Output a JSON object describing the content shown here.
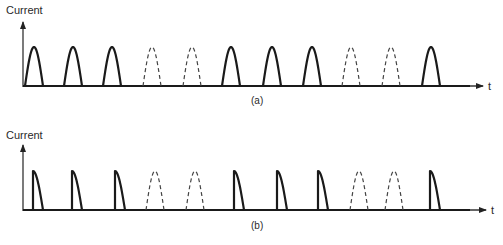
{
  "panels": [
    {
      "id": "a",
      "y_label": "Current",
      "x_label": "t",
      "caption": "(a)",
      "pulse_shape": "full half-sine",
      "pulses": [
        "solid",
        "solid",
        "solid",
        "dashed",
        "dashed",
        "solid",
        "solid",
        "solid",
        "dashed",
        "dashed",
        "solid"
      ]
    },
    {
      "id": "b",
      "y_label": "Current",
      "x_label": "t",
      "caption": "(b)",
      "pulse_shape": "phase-chopped (trailing portion) for solid; full half-sine for dashed",
      "pulses": [
        "solid",
        "solid",
        "solid",
        "dashed",
        "dashed",
        "solid",
        "solid",
        "solid",
        "dashed",
        "dashed",
        "solid"
      ]
    }
  ],
  "chart_data": [
    {
      "type": "line",
      "title": "(a)",
      "xlabel": "t",
      "ylabel": "Current",
      "description": "Half-wave rectified pulse train; 11 pulse slots, pattern 3 conducting, 2 skipped (dashed), 3 conducting, 2 skipped, 1 conducting",
      "pulse_start_x": [
        25,
        64,
        103,
        143,
        183,
        222,
        263,
        303,
        342,
        382,
        422
      ],
      "pulse_width": 18,
      "pulse_style": [
        "solid",
        "solid",
        "solid",
        "dashed",
        "dashed",
        "solid",
        "solid",
        "solid",
        "dashed",
        "dashed",
        "solid"
      ],
      "baseline_y": 86,
      "peak_y": 47,
      "axis_origin": [
        22,
        86
      ],
      "axis_x_end": 482,
      "axis_y_top": 24
    },
    {
      "type": "line",
      "title": "(b)",
      "xlabel": "t",
      "ylabel": "Current",
      "description": "Phase-controlled pulse train; conducting pulses begin at peak (vertical rise) then decay; skipped slots shown as dashed full half-sines",
      "pulse_start_x": [
        33,
        72,
        115,
        146,
        186,
        234,
        277,
        318,
        350,
        385,
        430
      ],
      "pulse_width_chopped": 10,
      "pulse_width_full": 18,
      "pulse_style": [
        "solid",
        "solid",
        "solid",
        "dashed",
        "dashed",
        "solid",
        "solid",
        "solid",
        "dashed",
        "dashed",
        "solid"
      ],
      "baseline_y": 210,
      "peak_y": 171,
      "axis_origin": [
        22,
        210
      ],
      "axis_x_end": 485,
      "axis_y_top": 147
    }
  ]
}
